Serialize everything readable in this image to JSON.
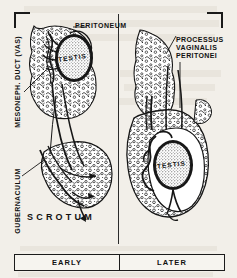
{
  "figure": {
    "panels": [
      {
        "id": "early",
        "caption": "EARLY"
      },
      {
        "id": "later",
        "caption": "LATER"
      }
    ],
    "labels": {
      "peritoneum": "PERITONEUM",
      "processus_vaginalis": "PROCESSUS\nVAGINALIS\nPERITONEI",
      "mesoneph_duct": "MESONEPH. DUCT (VAS)",
      "gubernaculum": "GUBERNACULUM",
      "scrotum": "SCROTUM",
      "testis_left": "TESTIS",
      "testis_right": "TESTIS"
    },
    "colors": {
      "ink": "#111111",
      "paper": "#f2efe9",
      "stipple": "#3a3a3a",
      "bar_fill": "#f6f4ef"
    }
  }
}
